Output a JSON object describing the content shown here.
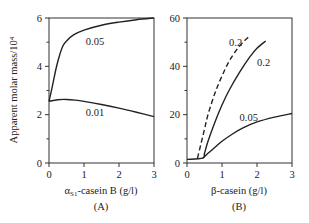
{
  "chart_data": [
    {
      "panel": "A",
      "type": "line",
      "title": "",
      "panel_label": "(A)",
      "xlabel": "αS1-casein B (g/l)",
      "xlabel_main": "α",
      "xlabel_sub": "S1",
      "xlabel_rest": "-casein B (g/l)",
      "ylabel": "Apparent molar mass/10⁴",
      "xlim": [
        0,
        3
      ],
      "ylim": [
        0,
        6
      ],
      "xticks": [
        "0",
        "1",
        "2",
        "3"
      ],
      "yticks": [
        "0",
        "2",
        "4",
        "6"
      ],
      "grid": false,
      "series": [
        {
          "name": "0.05",
          "style": "solid",
          "x": [
            0,
            0.1,
            0.2,
            0.3,
            0.4,
            0.5,
            0.7,
            1.0,
            1.5,
            2.0,
            2.5,
            3.0
          ],
          "y": [
            2.55,
            3.2,
            3.9,
            4.45,
            4.85,
            5.05,
            5.3,
            5.5,
            5.7,
            5.83,
            5.93,
            6.0
          ]
        },
        {
          "name": "0.01",
          "style": "solid",
          "x": [
            0,
            0.25,
            0.5,
            0.75,
            1.0,
            1.5,
            2.0,
            2.5,
            3.0
          ],
          "y": [
            2.55,
            2.62,
            2.63,
            2.6,
            2.55,
            2.42,
            2.27,
            2.1,
            1.92
          ]
        }
      ],
      "annotations": [
        {
          "text": "0.05",
          "x": 1.05,
          "y": 5.05
        },
        {
          "text": "0.01",
          "x": 1.05,
          "y": 2.1
        }
      ]
    },
    {
      "panel": "B",
      "type": "line",
      "title": "",
      "panel_label": "(B)",
      "xlabel": "β-casein (g/l)",
      "ylabel": "Apparent molar mass/10⁴",
      "xlim": [
        0,
        3
      ],
      "ylim": [
        0,
        60
      ],
      "xticks": [
        "0",
        "1",
        "2",
        "3"
      ],
      "yticks": [
        "0",
        "20",
        "40",
        "60"
      ],
      "grid": false,
      "series": [
        {
          "name": "0.2 (dashed)",
          "style": "dashed",
          "x": [
            0.3,
            0.4,
            0.5,
            0.6,
            0.8,
            1.0,
            1.2,
            1.4,
            1.6,
            1.75
          ],
          "y": [
            2,
            8,
            14,
            20,
            29,
            36,
            42,
            46.5,
            50,
            52
          ]
        },
        {
          "name": "0.2",
          "style": "solid",
          "x": [
            0.0,
            0.45,
            0.5,
            0.6,
            0.8,
            1.0,
            1.2,
            1.5,
            1.8,
            2.0,
            2.25
          ],
          "y": [
            1.5,
            2,
            4,
            9,
            17,
            24,
            30,
            37.5,
            44,
            47.5,
            50.5
          ]
        },
        {
          "name": "0.05",
          "style": "solid",
          "x": [
            0.45,
            0.6,
            0.8,
            1.0,
            1.3,
            1.6,
            2.0,
            2.5,
            3.0
          ],
          "y": [
            2,
            4,
            6.5,
            9,
            12,
            14.5,
            17,
            19,
            20.5
          ]
        }
      ],
      "annotations": [
        {
          "text": "0.2",
          "x": 1.2,
          "y": 50
        },
        {
          "text": "0.2",
          "x": 2.0,
          "y": 42
        },
        {
          "text": "0.05",
          "x": 1.5,
          "y": 19
        }
      ]
    }
  ]
}
